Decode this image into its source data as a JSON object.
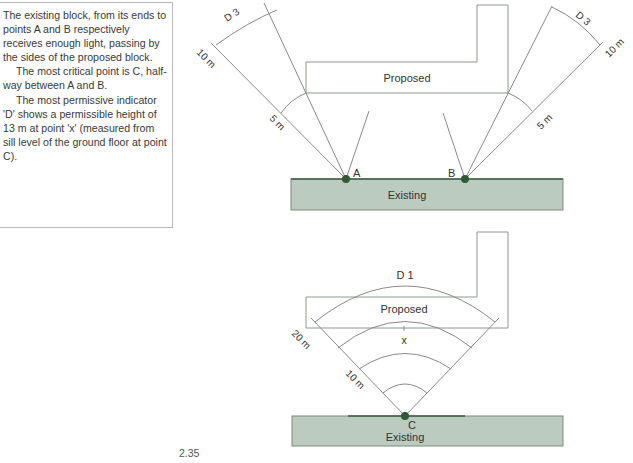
{
  "sidebar_note": {
    "paragraphs": [
      "The existing block, from its ends to points A and B respectively receives enough light, passing by the sides of the proposed block.",
      "The most critical point is C, half-way between A and B.",
      "The most permissive indicator 'D' shows a permissible height of 13 m at point 'x' (measured from sill level of the ground floor at point C)."
    ]
  },
  "top_diagram": {
    "proposed_label": "Proposed",
    "existing_label": "Existing",
    "point_a_label": "A",
    "point_b_label": "B",
    "left_fan": {
      "indicator": "D 3",
      "outer_distance": "10 m",
      "inner_distance": "5 m"
    },
    "right_fan": {
      "indicator": "D 3",
      "outer_distance": "10 m",
      "inner_distance": "5 m"
    }
  },
  "bottom_diagram": {
    "proposed_label": "Proposed",
    "existing_label": "Existing",
    "point_c_label": "C",
    "point_x_label": "x",
    "indicator": "D 1",
    "outer_distance": "20 m",
    "inner_distance": "10 m"
  },
  "figure_number": "2.35",
  "colors": {
    "existing_fill": "#bccbbf",
    "existing_stroke": "#7d8a80",
    "point_fill": "#2f5a35",
    "line": "#8a8a8a",
    "proposed_stroke": "#8a9a8c"
  }
}
